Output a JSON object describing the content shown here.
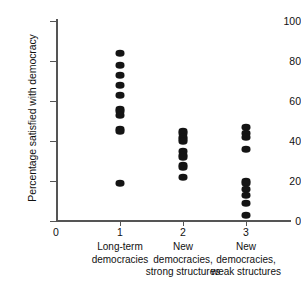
{
  "chart_data": {
    "type": "scatter",
    "title": "",
    "xlabel": "",
    "ylabel": "Percentage satisfied with democracy",
    "ylim": [
      0,
      100
    ],
    "yticks": [
      0,
      20,
      40,
      60,
      80,
      100
    ],
    "ytick_labels": [
      "0",
      "20",
      "40",
      "60",
      "80",
      "100"
    ],
    "xticks": [
      1,
      2,
      3
    ],
    "xtick_labels": [
      "1",
      "2",
      "3"
    ],
    "xlim": [
      0,
      3.6
    ],
    "grid": false,
    "legend": null,
    "origin_label": "0",
    "categories": [
      {
        "x": 1,
        "tick_label": "1",
        "lines": [
          "Long-term",
          "democracies"
        ],
        "values": [
          84,
          78,
          73,
          68,
          63,
          56,
          55,
          53,
          46,
          45,
          19
        ]
      },
      {
        "x": 2,
        "tick_label": "2",
        "lines": [
          "New",
          "democracies,",
          "strong structures"
        ],
        "values": [
          45,
          44,
          42,
          41,
          40,
          35,
          33,
          32,
          28,
          27,
          22
        ]
      },
      {
        "x": 3,
        "tick_label": "3",
        "lines": [
          "New",
          "democracies,",
          "weak structures"
        ],
        "values": [
          47,
          44,
          42,
          36,
          20,
          19,
          16,
          13,
          9,
          3
        ]
      }
    ],
    "marker": {
      "shape": "ellipse",
      "color": "#141414",
      "width_px": 9,
      "height_px": 6.5
    },
    "axis_color": "#555555"
  }
}
